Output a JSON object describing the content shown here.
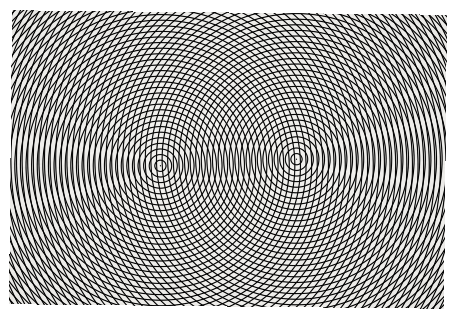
{
  "image": {
    "title": "Moire interference pattern of two concentric-circle ring gratings",
    "subject": "moire-pattern",
    "medium": "black-and-white photograph of a printed ring-grating overlay",
    "width": 454,
    "height": 317
  },
  "canvas": {
    "width": 454,
    "height": 317,
    "background_color": "#ffffff",
    "border_color": "#ffffff"
  },
  "plate": {
    "label": "printed pattern plate",
    "left": 10,
    "top": 12,
    "right": 445,
    "bottom": 306,
    "width": 435,
    "height": 294,
    "paper_color": "#f2f1ee",
    "ink_color": "#16161a",
    "corner_tilt_degrees": 0.6
  },
  "chart_data": {
    "type": "scatter",
    "xlabel": "",
    "ylabel": "",
    "xlim": [
      10,
      445
    ],
    "ylim": [
      12,
      306
    ],
    "grid": false,
    "legend_position": "none",
    "pattern_type": "two-source-concentric-ring-moire",
    "ring_spacing_px": 5.6,
    "ring_line_width_px": 1.15,
    "ring_count_per_source": 96,
    "sources": [
      {
        "name": "ring-grating-left",
        "center_x": 160,
        "center_y": 166,
        "spacing_px": 5.6,
        "phase_px": 0.0,
        "ink_color": "#16161a"
      },
      {
        "name": "ring-grating-right",
        "center_x": 296,
        "center_y": 158,
        "spacing_px": 5.6,
        "phase_px": 0.0,
        "ink_color": "#16161a"
      }
    ],
    "derived": {
      "source_separation_px": 136.2,
      "midpoint_x": 228,
      "midpoint_y": 162,
      "fringe_family": "confocal hyperbolae about the two centers",
      "visible_hyperbolic_fringe_orders": [
        0,
        1,
        2,
        3,
        4,
        5,
        6,
        7,
        8,
        9,
        10,
        11,
        12
      ],
      "dark_beat_spot_description": "dark moire beat spots densest in the outer corners, resolving into individual ring crossings near the two centers",
      "central_lens_region": "overlapping rings form a lens / interference zone between the two centers",
      "contrast_min_gray": 12,
      "contrast_max_gray": 247
    },
    "annotations": []
  },
  "accessibility": {
    "alt_text": "A black and white photograph of a moire pattern formed by two overlapping sets of concentric circles. One set is centred left of middle and the other right of middle. Where the rings cross they create a dense field of dark dots arranged along hyperbolic curves that fan outward to the corners of the rectangular plate."
  }
}
